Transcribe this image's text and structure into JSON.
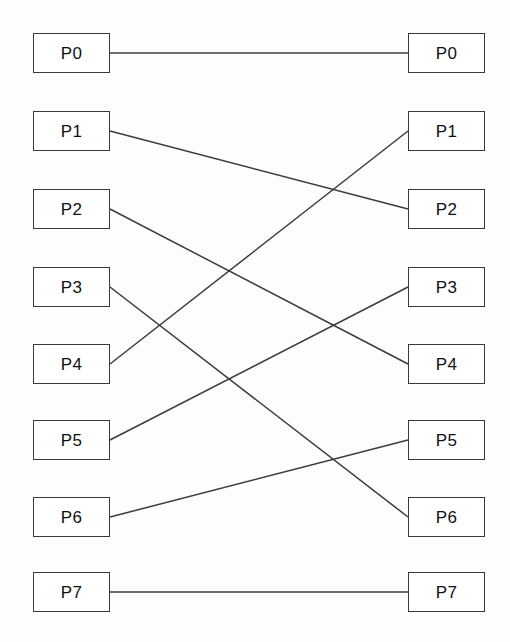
{
  "diagram": {
    "type": "bipartite-node-link",
    "canvas": {
      "width": 510,
      "height": 642
    },
    "colors": {
      "background": "#fdfdfc",
      "box_fill": "#ffffff",
      "box_stroke": "#3a3a3a",
      "wire_stroke": "#3c3c3c",
      "label_text": "#111111"
    },
    "geometry": {
      "left_column_x": 33,
      "left_column_width": 77,
      "right_column_x": 408,
      "right_column_width": 77,
      "box_height": 40,
      "row_centers": [
        53,
        131,
        209,
        287,
        364,
        440,
        517,
        592
      ]
    },
    "left_nodes": [
      {
        "id": "L0",
        "label": "P0",
        "x": 33,
        "y": 33,
        "w": 77,
        "h": 40,
        "cy": 53
      },
      {
        "id": "L1",
        "label": "P1",
        "x": 33,
        "y": 111,
        "w": 77,
        "h": 40,
        "cy": 131
      },
      {
        "id": "L2",
        "label": "P2",
        "x": 33,
        "y": 189,
        "w": 77,
        "h": 40,
        "cy": 209
      },
      {
        "id": "L3",
        "label": "P3",
        "x": 33,
        "y": 267,
        "w": 77,
        "h": 40,
        "cy": 287
      },
      {
        "id": "L4",
        "label": "P4",
        "x": 33,
        "y": 344,
        "w": 77,
        "h": 40,
        "cy": 364
      },
      {
        "id": "L5",
        "label": "P5",
        "x": 33,
        "y": 420,
        "w": 77,
        "h": 40,
        "cy": 440
      },
      {
        "id": "L6",
        "label": "P6",
        "x": 33,
        "y": 497,
        "w": 77,
        "h": 40,
        "cy": 517
      },
      {
        "id": "L7",
        "label": "P7",
        "x": 33,
        "y": 572,
        "w": 77,
        "h": 40,
        "cy": 592
      }
    ],
    "right_nodes": [
      {
        "id": "R0",
        "label": "P0",
        "x": 408,
        "y": 33,
        "w": 77,
        "h": 40,
        "cy": 53
      },
      {
        "id": "R1",
        "label": "P1",
        "x": 408,
        "y": 111,
        "w": 77,
        "h": 40,
        "cy": 131
      },
      {
        "id": "R2",
        "label": "P2",
        "x": 408,
        "y": 189,
        "w": 77,
        "h": 40,
        "cy": 209
      },
      {
        "id": "R3",
        "label": "P3",
        "x": 408,
        "y": 267,
        "w": 77,
        "h": 40,
        "cy": 287
      },
      {
        "id": "R4",
        "label": "P4",
        "x": 408,
        "y": 344,
        "w": 77,
        "h": 40,
        "cy": 364
      },
      {
        "id": "R5",
        "label": "P5",
        "x": 408,
        "y": 420,
        "w": 77,
        "h": 40,
        "cy": 440
      },
      {
        "id": "R6",
        "label": "P6",
        "x": 408,
        "y": 497,
        "w": 77,
        "h": 40,
        "cy": 517
      },
      {
        "id": "R7",
        "label": "P7",
        "x": 408,
        "y": 572,
        "w": 77,
        "h": 40,
        "cy": 592
      }
    ],
    "edges": [
      {
        "from": "L0",
        "to": "R0",
        "from_label": "P0",
        "to_label": "P0",
        "x1": 110,
        "y1": 53,
        "x2": 408,
        "y2": 53
      },
      {
        "from": "L1",
        "to": "R2",
        "from_label": "P1",
        "to_label": "P2",
        "x1": 110,
        "y1": 131,
        "x2": 408,
        "y2": 209
      },
      {
        "from": "L2",
        "to": "R4",
        "from_label": "P2",
        "to_label": "P4",
        "x1": 110,
        "y1": 209,
        "x2": 408,
        "y2": 364
      },
      {
        "from": "L3",
        "to": "R6",
        "from_label": "P3",
        "to_label": "P6",
        "x1": 110,
        "y1": 287,
        "x2": 408,
        "y2": 517
      },
      {
        "from": "L4",
        "to": "R1",
        "from_label": "P4",
        "to_label": "P1",
        "x1": 110,
        "y1": 364,
        "x2": 408,
        "y2": 131
      },
      {
        "from": "L5",
        "to": "R3",
        "from_label": "P5",
        "to_label": "P3",
        "x1": 110,
        "y1": 440,
        "x2": 408,
        "y2": 287
      },
      {
        "from": "L6",
        "to": "R5",
        "from_label": "P6",
        "to_label": "P5",
        "x1": 110,
        "y1": 517,
        "x2": 408,
        "y2": 440
      },
      {
        "from": "L7",
        "to": "R7",
        "from_label": "P7",
        "to_label": "P7",
        "x1": 110,
        "y1": 592,
        "x2": 408,
        "y2": 592
      }
    ]
  }
}
